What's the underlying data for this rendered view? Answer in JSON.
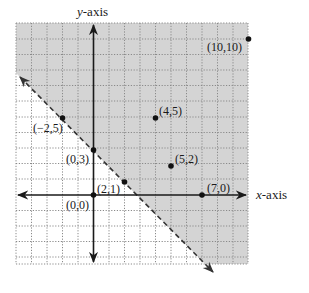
{
  "diagram": {
    "type": "linear-inequality-graph",
    "axis_labels": {
      "x": "x-axis",
      "y": "y-axis"
    },
    "colors": {
      "shaded_region": "#d4d4d4",
      "grid": "#8a8a8a",
      "axis": "#1a1a1a",
      "boundary": "#444444"
    },
    "boundary": {
      "style": "dashed",
      "description": "line through (0,3) and (2,1)",
      "equation": "x + y = 3"
    },
    "shaded_side": "above-right of boundary",
    "points": [
      {
        "label": "(−2,5)",
        "x": -2,
        "y": 5
      },
      {
        "label": "(0,3)",
        "x": 0,
        "y": 3
      },
      {
        "label": "(2,1)",
        "x": 2,
        "y": 1
      },
      {
        "label": "(4,5)",
        "x": 4,
        "y": 5
      },
      {
        "label": "(5,2)",
        "x": 5,
        "y": 2
      },
      {
        "label": "(7,0)",
        "x": 7,
        "y": 0
      },
      {
        "label": "(0,0)",
        "x": 0,
        "y": 0
      },
      {
        "label": "(10,10)",
        "x": 10,
        "y": 10
      }
    ]
  }
}
